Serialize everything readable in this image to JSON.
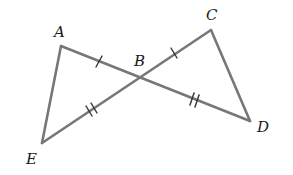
{
  "diagram": {
    "type": "geometry",
    "colors": {
      "segment": "#777777",
      "tick": "#333333",
      "label": "#1a1a1a",
      "background": "#ffffff"
    },
    "points": {
      "A": {
        "label": "A",
        "x": 61,
        "y": 46,
        "label_x": 54,
        "label_y": 37
      },
      "B": {
        "label": "B",
        "x": 140,
        "y": 77,
        "label_x": 134,
        "label_y": 66
      },
      "C": {
        "label": "C",
        "x": 211,
        "y": 30,
        "label_x": 206,
        "label_y": 20
      },
      "D": {
        "label": "D",
        "x": 250,
        "y": 121,
        "label_x": 257,
        "label_y": 132
      },
      "E": {
        "label": "E",
        "x": 42,
        "y": 143,
        "label_x": 26,
        "label_y": 164
      }
    },
    "segments": [
      {
        "from": "A",
        "to": "D",
        "name": "segment-AD"
      },
      {
        "from": "C",
        "to": "E",
        "name": "segment-CE"
      },
      {
        "from": "A",
        "to": "E",
        "name": "segment-AE"
      },
      {
        "from": "C",
        "to": "D",
        "name": "segment-CD"
      }
    ],
    "congruence_marks": [
      {
        "segment": "AB",
        "ticks": 1
      },
      {
        "segment": "BC",
        "ticks": 1
      },
      {
        "segment": "EB",
        "ticks": 2
      },
      {
        "segment": "BD",
        "ticks": 2
      }
    ]
  }
}
